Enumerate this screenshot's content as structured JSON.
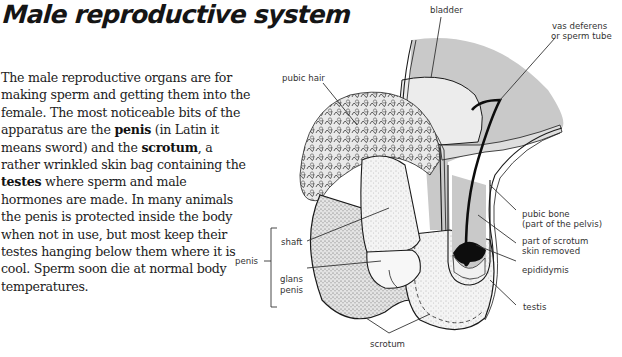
{
  "title": "Male reproductive system",
  "paragraph": {
    "segments": [
      {
        "text": "The male reproductive organs are for making sperm and getting them into the female. The most noticeable bits of the apparatus are the ",
        "bold": false
      },
      {
        "text": "penis",
        "bold": true
      },
      {
        "text": " (in Latin it means sword) and the ",
        "bold": false
      },
      {
        "text": "scrotum",
        "bold": true
      },
      {
        "text": ", a rather wrinkled skin bag containing the ",
        "bold": false
      },
      {
        "text": "testes",
        "bold": true
      },
      {
        "text": " where sperm and male hormones are made. In many animals the penis is protected inside the body when not in use, but most keep their testes hanging below them where it is cool. Sperm soon die at normal body temperatures.",
        "bold": false
      }
    ]
  },
  "diagram": {
    "colors": {
      "pelvis_fill": "#c9c9c9",
      "bladder_fill": "#ececec",
      "testis_dark": "#0d0d0d",
      "line": "#1a1a1a"
    },
    "labels": {
      "bladder": "bladder",
      "vas_deferens_1": "vas deferens",
      "vas_deferens_2": "or sperm tube",
      "pubic_hair": "pubic hair",
      "shaft": "shaft",
      "penis": "penis",
      "glans_1": "glans",
      "glans_2": "penis",
      "pubic_bone_1": "pubic bone",
      "pubic_bone_2": "(part of the pelvis)",
      "scrotum_skin_1": "part of scrotum",
      "scrotum_skin_2": "skin removed",
      "epididymis": "epididymis",
      "testis": "testis",
      "scrotum": "scrotum"
    }
  }
}
